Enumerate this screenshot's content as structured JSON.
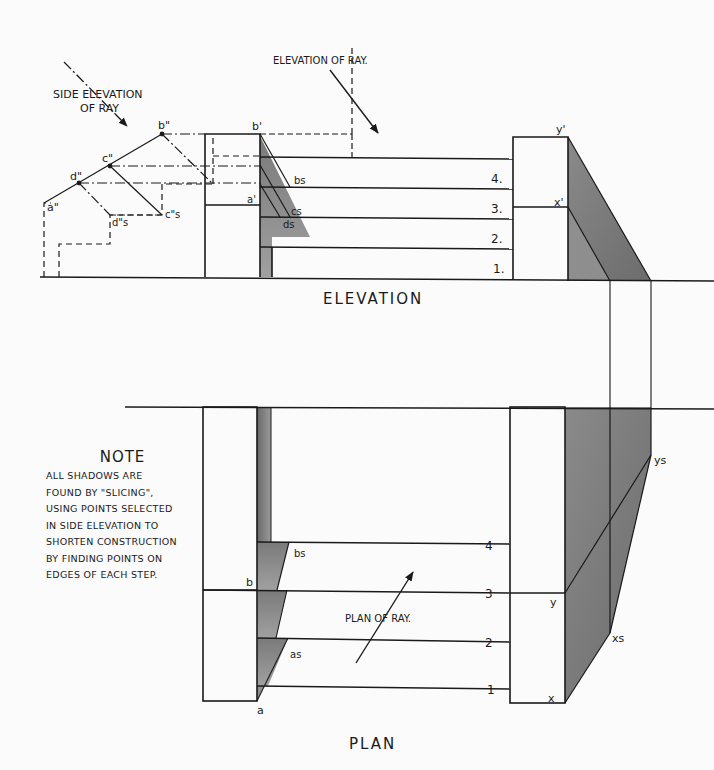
{
  "titles": {
    "elevation": "ELEVATION",
    "plan": "PLAN"
  },
  "rays": {
    "side_elevation": [
      "SIDE ELEVATION",
      "OF RAY"
    ],
    "elevation": "ELEVATION OF RAY.",
    "plan": "PLAN OF RAY."
  },
  "points": {
    "b_dd": "b\"",
    "c_dd": "c\"",
    "d_dd": "d\"",
    "a_dd": "a\"",
    "ds_dd": "d\"s",
    "cs_dd": "c\"s",
    "b_d": "b'",
    "a_d": "a'",
    "bs_e": "bs",
    "cs_e": "cs",
    "ds_e": "ds",
    "y_d": "y'",
    "x_d": "x'",
    "b": "b",
    "a": "a",
    "bs": "bs",
    "as": "as",
    "y": "y",
    "x": "x",
    "ys": "ys",
    "xs": "xs"
  },
  "steps_elevation": [
    "4.",
    "3.",
    "2.",
    "1."
  ],
  "steps_plan": [
    "4",
    "3",
    "2",
    "1"
  ],
  "note": {
    "heading": "NOTE",
    "lines": [
      "ALL SHADOWS ARE",
      "FOUND BY \"SLICING\",",
      "USING POINTS SELECTED",
      "IN SIDE ELEVATION TO",
      "SHORTEN CONSTRUCTION",
      "BY FINDING POINTS ON",
      "EDGES OF EACH STEP."
    ]
  },
  "colors": {
    "ink": "#1a1a1a",
    "shadow_dark": "#6e6e6e",
    "shadow_mid": "#8c8c8c",
    "shadow_light": "#a8a8a8",
    "paper": "#fbfbfb"
  }
}
